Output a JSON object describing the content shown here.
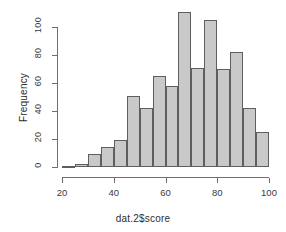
{
  "chart_data": {
    "type": "bar",
    "title": "",
    "subtitle": "",
    "xlabel": "dat.2$score",
    "ylabel": "Frequency",
    "bin_width": 5,
    "bin_starts": [
      20,
      25,
      30,
      35,
      40,
      45,
      50,
      55,
      60,
      65,
      70,
      75,
      80,
      85,
      90,
      95
    ],
    "bin_ends": [
      25,
      30,
      35,
      40,
      45,
      50,
      55,
      60,
      65,
      70,
      75,
      80,
      85,
      90,
      95,
      100
    ],
    "categories": [
      "20-25",
      "25-30",
      "30-35",
      "35-40",
      "40-45",
      "45-50",
      "50-55",
      "55-60",
      "60-65",
      "65-70",
      "70-75",
      "75-80",
      "80-85",
      "85-90",
      "90-95",
      "95-100"
    ],
    "values": [
      1,
      2,
      9,
      14,
      19,
      51,
      42,
      65,
      58,
      111,
      71,
      105,
      70,
      82,
      42,
      25
    ],
    "xlim": [
      20,
      100
    ],
    "ylim": [
      0,
      111
    ],
    "xticks": [
      20,
      40,
      60,
      80,
      100
    ],
    "yticks": [
      0,
      20,
      40,
      60,
      80,
      100
    ],
    "xtick_labels": [
      "20",
      "40",
      "60",
      "80",
      "100"
    ],
    "ytick_labels": [
      "0",
      "20",
      "40",
      "60",
      "80",
      "100"
    ],
    "grid": false,
    "legend": false,
    "bar_fill_color": "#c9c9c9",
    "bar_border_color": "#5e5e5e",
    "axis_color": "#6e6e6e",
    "text_color": "#2e2e2e",
    "background_color": "#ffffff"
  }
}
